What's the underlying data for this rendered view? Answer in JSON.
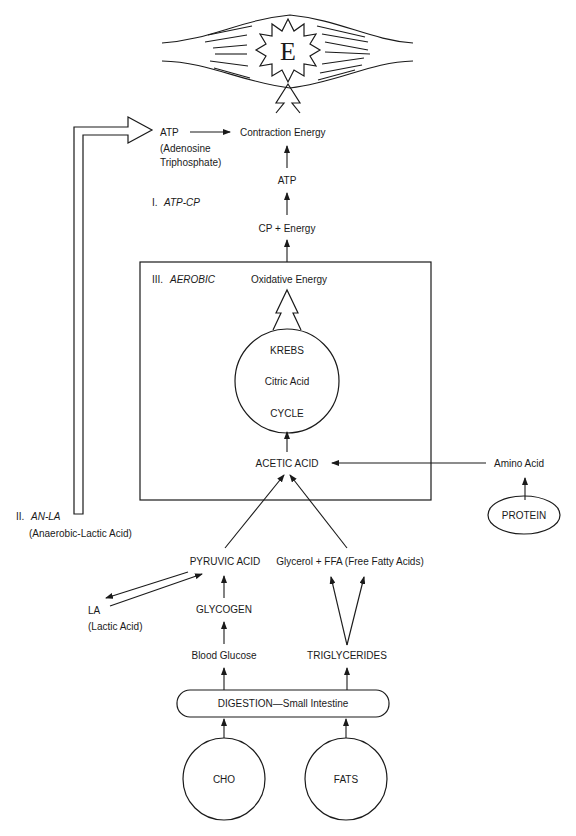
{
  "diagram": {
    "muscle": {
      "label": "E"
    },
    "top": {
      "atp_label": "ATP",
      "atp_full_1": "(Adenosine",
      "atp_full_2": "Triphosphate)",
      "contraction_energy": "Contraction Energy",
      "atp_middle": "ATP",
      "cp_energy": "CP + Energy"
    },
    "systems": {
      "atp_cp_numeral": "I.",
      "atp_cp_name": "ATP-CP",
      "an_la_numeral": "II.",
      "an_la_name": "AN-LA",
      "an_la_full": "(Anaerobic-Lactic Acid)",
      "aerobic_numeral": "III.",
      "aerobic_name": "AEROBIC"
    },
    "aerobic_box": {
      "oxidative_energy": "Oxidative Energy",
      "krebs_line1": "KREBS",
      "krebs_line2": "Citric Acid",
      "krebs_line3": "CYCLE",
      "acetic_acid": "ACETIC ACID"
    },
    "protein_branch": {
      "amino_acid": "Amino Acid",
      "protein": "PROTEIN"
    },
    "carb_branch": {
      "pyruvic_acid": "PYRUVIC ACID",
      "la": "LA",
      "la_full": "(Lactic Acid)",
      "glycogen": "GLYCOGEN",
      "blood_glucose": "Blood Glucose"
    },
    "fat_branch": {
      "glycerol_ffa": "Glycerol + FFA (Free Fatty Acids)",
      "triglycerides": "TRIGLYCERIDES"
    },
    "digestion": {
      "label": "DIGESTION—Small Intestine"
    },
    "sources": {
      "cho": "CHO",
      "fats": "FATS"
    }
  }
}
